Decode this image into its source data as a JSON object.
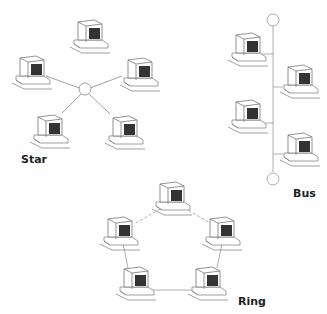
{
  "labels": {
    "star": "Star",
    "bus": "Bus",
    "ring": "Ring"
  },
  "colors": {
    "line": "#777777",
    "screen": "#333333",
    "background": "#ffffff"
  }
}
